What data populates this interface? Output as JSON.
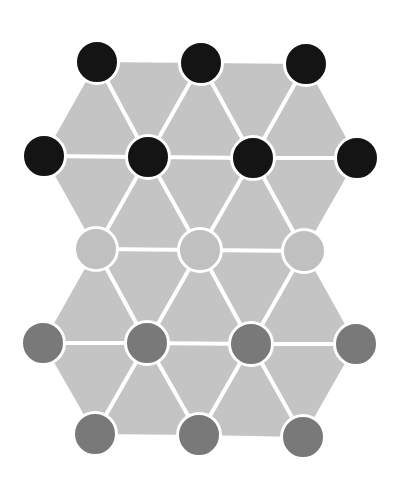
{
  "canvas": {
    "width": 411,
    "height": 479,
    "background": "#ffffff"
  },
  "colors": {
    "tile_fill": "#c4c4c4",
    "edge": "#ffffff",
    "black_atom": "#141414",
    "light_atom": "#c0c0c0",
    "dark_atom": "#797979",
    "atom_outline": "#ffffff"
  },
  "geometry": {
    "atom_radius": 21.5,
    "edge_width": 4,
    "outline_width": 3
  },
  "rows": [
    {
      "name": "row-1",
      "type": "black_atom",
      "nodes": [
        [
          97,
          62
        ],
        [
          201,
          63
        ],
        [
          306,
          64
        ]
      ]
    },
    {
      "name": "row-2",
      "type": "black_atom",
      "nodes": [
        [
          44,
          156
        ],
        [
          148,
          157
        ],
        [
          253,
          158
        ],
        [
          357,
          158
        ]
      ]
    },
    {
      "name": "row-3",
      "type": "light_atom",
      "nodes": [
        [
          96,
          249
        ],
        [
          200,
          250
        ],
        [
          304,
          251
        ]
      ]
    },
    {
      "name": "row-4",
      "type": "dark_atom",
      "nodes": [
        [
          43,
          343
        ],
        [
          147,
          343
        ],
        [
          251,
          344
        ],
        [
          356,
          344
        ]
      ]
    },
    {
      "name": "row-5",
      "type": "dark_atom",
      "nodes": [
        [
          95,
          434
        ],
        [
          199,
          435
        ],
        [
          303,
          437
        ]
      ]
    }
  ],
  "triangles": [
    [
      [
        0,
        0
      ],
      [
        0,
        1
      ],
      [
        1,
        1
      ]
    ],
    [
      [
        0,
        1
      ],
      [
        0,
        2
      ],
      [
        1,
        2
      ]
    ],
    [
      [
        1,
        0
      ],
      [
        0,
        0
      ],
      [
        1,
        1
      ]
    ],
    [
      [
        1,
        1
      ],
      [
        0,
        1
      ],
      [
        1,
        2
      ]
    ],
    [
      [
        1,
        2
      ],
      [
        0,
        2
      ],
      [
        1,
        3
      ]
    ],
    [
      [
        1,
        0
      ],
      [
        1,
        1
      ],
      [
        2,
        0
      ]
    ],
    [
      [
        1,
        1
      ],
      [
        1,
        2
      ],
      [
        2,
        1
      ]
    ],
    [
      [
        1,
        2
      ],
      [
        1,
        3
      ],
      [
        2,
        2
      ]
    ],
    [
      [
        2,
        0
      ],
      [
        1,
        1
      ],
      [
        2,
        1
      ]
    ],
    [
      [
        2,
        1
      ],
      [
        1,
        2
      ],
      [
        2,
        2
      ]
    ],
    [
      [
        2,
        0
      ],
      [
        2,
        1
      ],
      [
        3,
        1
      ]
    ],
    [
      [
        2,
        1
      ],
      [
        2,
        2
      ],
      [
        3,
        2
      ]
    ],
    [
      [
        3,
        0
      ],
      [
        2,
        0
      ],
      [
        3,
        1
      ]
    ],
    [
      [
        3,
        1
      ],
      [
        2,
        1
      ],
      [
        3,
        2
      ]
    ],
    [
      [
        3,
        2
      ],
      [
        2,
        2
      ],
      [
        3,
        3
      ]
    ],
    [
      [
        3,
        0
      ],
      [
        3,
        1
      ],
      [
        4,
        0
      ]
    ],
    [
      [
        3,
        1
      ],
      [
        3,
        2
      ],
      [
        4,
        1
      ]
    ],
    [
      [
        3,
        2
      ],
      [
        3,
        3
      ],
      [
        4,
        2
      ]
    ],
    [
      [
        4,
        0
      ],
      [
        3,
        1
      ],
      [
        4,
        1
      ]
    ],
    [
      [
        4,
        1
      ],
      [
        3,
        2
      ],
      [
        4,
        2
      ]
    ]
  ]
}
